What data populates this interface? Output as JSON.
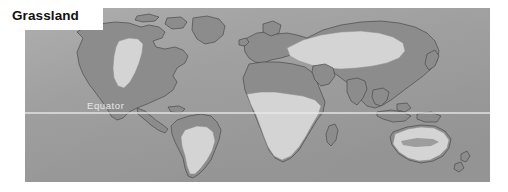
{
  "figure": {
    "title": "Grassland",
    "background_color": "#ffffff"
  },
  "map": {
    "type": "world-biome-distribution",
    "biome": "Grassland",
    "projection": "equirectangular",
    "ocean_color": "#9d9d9d",
    "land_color": "#8c8c8c",
    "highlight_color": "#d4d4d4",
    "outline_color": "#4a4a4a",
    "equator": {
      "label": "Equator",
      "line_color": "#ebebeb",
      "label_color": "#e8e8e8"
    },
    "legend_note": "Light shaded areas indicate grassland biome distribution",
    "highlighted_regions": [
      "North American Great Plains",
      "South American Cerrado and Pampas",
      "African Sahel and Savanna",
      "Southern African Veld",
      "Eurasian Steppe",
      "Australian Rangeland"
    ]
  }
}
